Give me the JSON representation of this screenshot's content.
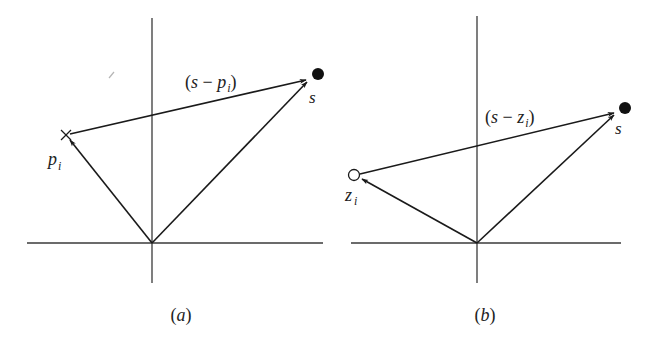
{
  "figure": {
    "panels": [
      {
        "id": "a",
        "caption": "(a)",
        "point_label": "p",
        "point_subscript": "i",
        "point_marker": "cross",
        "difference_vector_label_prefix": "(s − ",
        "difference_vector_label_var": "p",
        "difference_vector_label_sub": "i",
        "difference_vector_label_suffix": ")",
        "target_label": "s",
        "target_marker": "filled-circle"
      },
      {
        "id": "b",
        "caption": "(b)",
        "point_label": "z",
        "point_subscript": "i",
        "point_marker": "open-circle",
        "difference_vector_label_prefix": "(s − ",
        "difference_vector_label_var": "z",
        "difference_vector_label_sub": "i",
        "difference_vector_label_suffix": ")",
        "target_label": "s",
        "target_marker": "filled-circle"
      }
    ],
    "colors": {
      "ink": "#1a1a1a",
      "axis": "#3a3a3a",
      "background": "#ffffff"
    }
  }
}
